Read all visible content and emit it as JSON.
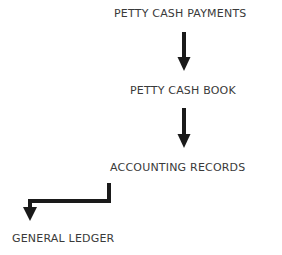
{
  "diagram": {
    "type": "flowchart",
    "nodes": [
      {
        "id": "petty_cash_payments",
        "label": "PETTY CASH PAYMENTS"
      },
      {
        "id": "petty_cash_book",
        "label": "PETTY CASH BOOK"
      },
      {
        "id": "accounting_records",
        "label": "ACCOUNTING RECORDS"
      },
      {
        "id": "general_ledger",
        "label": "GENERAL LEDGER"
      }
    ],
    "edges": [
      {
        "from": "petty_cash_payments",
        "to": "petty_cash_book",
        "style": "straight-down"
      },
      {
        "from": "petty_cash_book",
        "to": "accounting_records",
        "style": "straight-down"
      },
      {
        "from": "accounting_records",
        "to": "general_ledger",
        "style": "elbow-left-down"
      }
    ],
    "colors": {
      "text": "#3a3a3a",
      "arrow": "#1a1a1a",
      "background": "#ffffff"
    }
  }
}
